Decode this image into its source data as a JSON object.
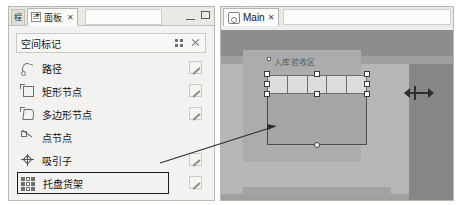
{
  "left_dock": {
    "collapsed_tab_label": "程",
    "active_tab": {
      "label": "面板",
      "icon": "panel-icon",
      "close_label": "✕"
    },
    "window_controls": {
      "minimize": "minimize-icon",
      "maximize": "maximize-icon"
    },
    "panel_header": {
      "title": "空间标记",
      "grid_icon": "grid-view-icon",
      "expand_icon": "expand-icon"
    },
    "marker_items": [
      {
        "label": "路径",
        "icon": "path-icon",
        "has_edit": true,
        "highlighted": false
      },
      {
        "label": "矩形节点",
        "icon": "rectangle-node-icon",
        "has_edit": true,
        "highlighted": false
      },
      {
        "label": "多边形节点",
        "icon": "polygon-node-icon",
        "has_edit": true,
        "highlighted": false
      },
      {
        "label": "点节点",
        "icon": "point-node-icon",
        "has_edit": false,
        "highlighted": false
      },
      {
        "label": "吸引子",
        "icon": "attractor-icon",
        "has_edit": true,
        "highlighted": false
      },
      {
        "label": "托盘货架",
        "icon": "pallet-rack-icon",
        "has_edit": true,
        "highlighted": true
      }
    ],
    "edit_icon_name": "edit-pencil-icon"
  },
  "right_dock": {
    "tab": {
      "label": "Main",
      "icon": "view-icon",
      "close_label": "✕"
    },
    "viewport": {
      "zone_label": "入库验收区",
      "rack_cell_count": 5,
      "selection_handle_count": 9,
      "move_gizmo": "move-horizontal-gizmo"
    }
  },
  "annotation": {
    "callout": "pallet-rack-to-viewport-connector"
  },
  "colors": {
    "panel_bg": "#f2f2f0",
    "tab_active_bg": "#fbfbf9",
    "border": "#b9b9b4",
    "viewport_bg": "#9a9a9a",
    "floor_light": "#b7b7b7",
    "floor_dark": "#868686",
    "handle_fill": "#ffffff",
    "handle_stroke": "#3b3b3b",
    "callout_stroke": "#2b2b2b"
  }
}
